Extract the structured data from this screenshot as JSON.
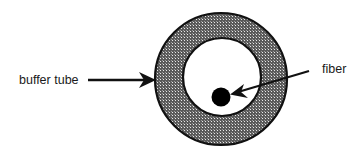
{
  "diagram": {
    "labels": {
      "buffer_tube": "buffer tube",
      "fiber": "fiber"
    },
    "colors": {
      "background": "#ffffff",
      "stroke": "#111111",
      "hatch_dark": "#5a5a5a",
      "hatch_light": "#e6e6e6",
      "fiber_core": "#000000",
      "text": "#1a1a1a"
    }
  }
}
